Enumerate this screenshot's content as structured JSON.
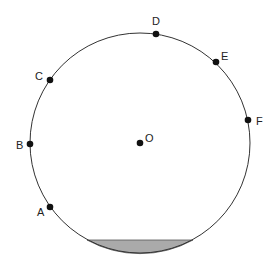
{
  "diagram": {
    "circle": {
      "cx": 140,
      "cy": 143,
      "r": 110,
      "stroke": "#333333"
    },
    "center": {
      "label": "O",
      "x": 140,
      "y": 143
    },
    "points": [
      {
        "label": "A",
        "x": 50,
        "y": 207
      },
      {
        "label": "B",
        "x": 30,
        "y": 144
      },
      {
        "label": "C",
        "x": 50,
        "y": 80
      },
      {
        "label": "D",
        "x": 156,
        "y": 34
      },
      {
        "label": "E",
        "x": 216,
        "y": 62
      },
      {
        "label": "F",
        "x": 248,
        "y": 120
      }
    ],
    "shaded_segment": {
      "chord_y": 240,
      "x1": 87,
      "x2": 193,
      "fill": "#aaaaaa"
    }
  }
}
